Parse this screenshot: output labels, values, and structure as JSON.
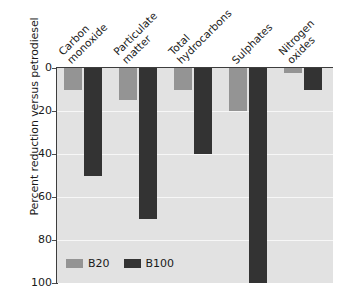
{
  "chart_data": {
    "type": "bar",
    "title": "",
    "xlabel": "",
    "ylabel": "Percent reduction versus petrodiesel",
    "categories": [
      "Carbon monoxide",
      "Particulate matter",
      "Total hydrocarbons",
      "Sulphates",
      "Nitrogen oxides"
    ],
    "category_lines": [
      [
        "Carbon",
        "monoxide"
      ],
      [
        "Particulate",
        "matter"
      ],
      [
        "Total",
        "hydrocarbons"
      ],
      [
        "Sulphates"
      ],
      [
        "Nitrogen",
        "oxides"
      ]
    ],
    "series": [
      {
        "name": "B20",
        "color": "#949494",
        "values": [
          10,
          15,
          10,
          20,
          2.5
        ]
      },
      {
        "name": "B100",
        "color": "#333333",
        "values": [
          50,
          70,
          40,
          100,
          10
        ]
      }
    ],
    "ylim": [
      0,
      100
    ],
    "y_inverted": true,
    "yticks": [
      0,
      20,
      40,
      60,
      80,
      100
    ],
    "ytick_labels": [
      "0",
      "20",
      "40",
      "60",
      "80",
      "100"
    ],
    "grid": true,
    "legend_position": "inside-bottom-left",
    "plot_background": "#e2e2e2",
    "gridline_color": "#f7f7f7",
    "axis_color": "#3d3d3d"
  },
  "legend": {
    "items": [
      {
        "label": "B20",
        "color": "#949494"
      },
      {
        "label": "B100",
        "color": "#333333"
      }
    ]
  }
}
